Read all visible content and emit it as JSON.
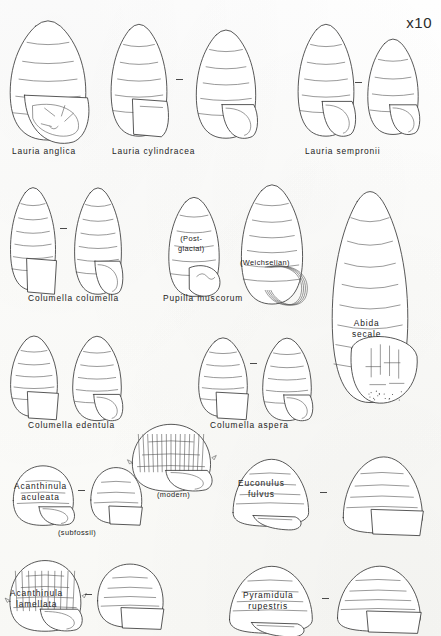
{
  "plate": {
    "scale_marker": "x10",
    "background_color": "#fdfdfb",
    "ink_color": "#3a3a3a",
    "width": 441,
    "height": 636
  },
  "species": [
    {
      "id": "lauria-anglica",
      "label": "Lauria anglica",
      "label_x": 12,
      "label_y": 146,
      "shells": [
        {
          "name": "lauria-anglica-view-1",
          "x": 6,
          "y": 12,
          "w": 84,
          "h": 130,
          "form": "ovate-toothed",
          "whorls": 6,
          "aperture": "toothed-detail"
        }
      ],
      "pair_dash": null,
      "notes": []
    },
    {
      "id": "lauria-cylindracea",
      "label": "Lauria cylindracea",
      "label_x": 112,
      "label_y": 146,
      "shells": [
        {
          "name": "lauria-cylindracea-view-1",
          "x": 108,
          "y": 16,
          "w": 62,
          "h": 122,
          "form": "cylindric-ovate",
          "whorls": 6,
          "aperture": "angular-flap"
        },
        {
          "name": "lauria-cylindracea-view-2",
          "x": 193,
          "y": 22,
          "w": 66,
          "h": 118,
          "form": "ovate",
          "whorls": 6,
          "aperture": "rounded-open"
        }
      ],
      "pair_dash": {
        "x": 176,
        "y": 79
      },
      "notes": []
    },
    {
      "id": "lauria-sempronii",
      "label": "Lauria sempronii",
      "label_x": 305,
      "label_y": 146,
      "shells": [
        {
          "name": "lauria-sempronii-view-1",
          "x": 295,
          "y": 16,
          "w": 62,
          "h": 122,
          "form": "ovate",
          "whorls": 6,
          "aperture": "rounded-open"
        },
        {
          "name": "lauria-sempronii-view-2",
          "x": 365,
          "y": 32,
          "w": 56,
          "h": 104,
          "form": "ovate",
          "whorls": 5,
          "aperture": "rounded-open"
        }
      ],
      "pair_dash": {
        "x": 355,
        "y": 82
      },
      "notes": []
    },
    {
      "id": "columella-columella",
      "label": "Columella columella",
      "label_x": 28,
      "label_y": 293,
      "shells": [
        {
          "name": "columella-columella-view-1",
          "x": 8,
          "y": 180,
          "w": 50,
          "h": 112,
          "form": "cylindric",
          "whorls": 7,
          "aperture": "flap"
        },
        {
          "name": "columella-columella-view-2",
          "x": 72,
          "y": 180,
          "w": 52,
          "h": 116,
          "form": "cylindric",
          "whorls": 7,
          "aperture": "rounded-open"
        }
      ],
      "pair_dash": {
        "x": 60,
        "y": 228
      },
      "notes": []
    },
    {
      "id": "pupilla-muscorum",
      "label": "Pupilla muscorum",
      "label_x": 163,
      "label_y": 293,
      "shells": [
        {
          "name": "pupilla-muscorum-postglacial",
          "x": 166,
          "y": 190,
          "w": 56,
          "h": 108,
          "form": "cylindric-ovate",
          "whorls": 6,
          "aperture": "lobed"
        },
        {
          "name": "pupilla-muscorum-weichselian",
          "x": 238,
          "y": 176,
          "w": 68,
          "h": 130,
          "form": "barrel",
          "whorls": 7,
          "aperture": "layered-lip"
        }
      ],
      "pair_dash": null,
      "notes": [
        {
          "name": "note-post-glacial",
          "text": "(Post-\nglacial)",
          "x": 178,
          "y": 234
        },
        {
          "name": "note-weichselian",
          "text": "(Weichselian)",
          "x": 240,
          "y": 258
        }
      ]
    },
    {
      "id": "abida-secale",
      "label": "Abida\nsecale",
      "label_x": 352,
      "label_y": 318,
      "shells": [
        {
          "name": "abida-secale-view-1",
          "x": 328,
          "y": 176,
          "w": 84,
          "h": 230,
          "form": "large-conic",
          "whorls": 9,
          "aperture": "multi-toothed"
        }
      ],
      "pair_dash": null,
      "notes": []
    },
    {
      "id": "columella-edentula",
      "label": "Columella edentula",
      "label_x": 28,
      "label_y": 420,
      "shells": [
        {
          "name": "columella-edentula-view-1",
          "x": 8,
          "y": 330,
          "w": 52,
          "h": 88,
          "form": "cylindric",
          "whorls": 6,
          "aperture": "flap"
        },
        {
          "name": "columella-edentula-view-2",
          "x": 70,
          "y": 330,
          "w": 54,
          "h": 92,
          "form": "cylindric",
          "whorls": 6,
          "aperture": "rounded-open"
        }
      ],
      "pair_dash": null,
      "notes": []
    },
    {
      "id": "columella-aspera",
      "label": "Columella aspera",
      "label_x": 210,
      "label_y": 420,
      "shells": [
        {
          "name": "columella-aspera-view-1",
          "x": 196,
          "y": 332,
          "w": 54,
          "h": 86,
          "form": "cylindric",
          "whorls": 6,
          "aperture": "flap"
        },
        {
          "name": "columella-aspera-view-2",
          "x": 260,
          "y": 332,
          "w": 54,
          "h": 90,
          "form": "cylindric",
          "whorls": 6,
          "aperture": "rounded-open"
        }
      ],
      "pair_dash": {
        "x": 250,
        "y": 363
      },
      "notes": []
    },
    {
      "id": "acanthinula-aculeata",
      "label": "Acanthinula\naculeata",
      "label_x": 14,
      "label_y": 481,
      "shells": [
        {
          "name": "acanthinula-aculeata-subfossil-view-1",
          "x": 10,
          "y": 462,
          "w": 66,
          "h": 64,
          "form": "globose",
          "whorls": 4,
          "aperture": "rounded-open"
        },
        {
          "name": "acanthinula-aculeata-subfossil-view-2",
          "x": 88,
          "y": 464,
          "w": 56,
          "h": 60,
          "form": "globose",
          "whorls": 4,
          "aperture": "flap"
        },
        {
          "name": "acanthinula-aculeata-modern",
          "x": 128,
          "y": 420,
          "w": 86,
          "h": 72,
          "form": "spined-ribbed",
          "whorls": 4,
          "aperture": "rounded-open"
        }
      ],
      "pair_dash": {
        "x": 78,
        "y": 490
      },
      "notes": [
        {
          "name": "note-subfossil",
          "text": "(subfossil)",
          "x": 58,
          "y": 528
        },
        {
          "name": "note-modern",
          "text": "(modern)",
          "x": 157,
          "y": 490
        }
      ]
    },
    {
      "id": "euconulus-fulvus",
      "label": "Euconulus\nfulvus",
      "label_x": 238,
      "label_y": 478,
      "shells": [
        {
          "name": "euconulus-fulvus-view-1",
          "x": 228,
          "y": 455,
          "w": 84,
          "h": 72,
          "form": "conic-depressed",
          "whorls": 5,
          "aperture": "slit"
        },
        {
          "name": "euconulus-fulvus-view-2",
          "x": 338,
          "y": 452,
          "w": 88,
          "h": 82,
          "form": "conic-depressed",
          "whorls": 5,
          "aperture": "flap"
        }
      ],
      "pair_dash": {
        "x": 320,
        "y": 492
      },
      "notes": []
    },
    {
      "id": "acanthinula-lamellata",
      "label": "Acanthinula\nlamellata",
      "label_x": 10,
      "label_y": 588,
      "shells": [
        {
          "name": "acanthinula-lamellata-view-1",
          "x": 6,
          "y": 556,
          "w": 78,
          "h": 76,
          "form": "globose-ribbed",
          "whorls": 5,
          "aperture": "rounded-open"
        },
        {
          "name": "acanthinula-lamellata-view-2",
          "x": 94,
          "y": 560,
          "w": 72,
          "h": 68,
          "form": "globose",
          "whorls": 5,
          "aperture": "flap"
        }
      ],
      "pair_dash": {
        "x": 85,
        "y": 594
      },
      "notes": []
    },
    {
      "id": "pyramidula-rupestris",
      "label": "Pyramidula\nrupestris",
      "label_x": 243,
      "label_y": 590,
      "shells": [
        {
          "name": "pyramidula-rupestris-view-1",
          "x": 224,
          "y": 562,
          "w": 92,
          "h": 72,
          "form": "depressed-conic",
          "whorls": 5,
          "aperture": "slit"
        },
        {
          "name": "pyramidula-rupestris-view-2",
          "x": 332,
          "y": 562,
          "w": 92,
          "h": 70,
          "form": "depressed-conic",
          "whorls": 5,
          "aperture": "flap"
        }
      ],
      "pair_dash": {
        "x": 322,
        "y": 598
      },
      "notes": []
    }
  ]
}
